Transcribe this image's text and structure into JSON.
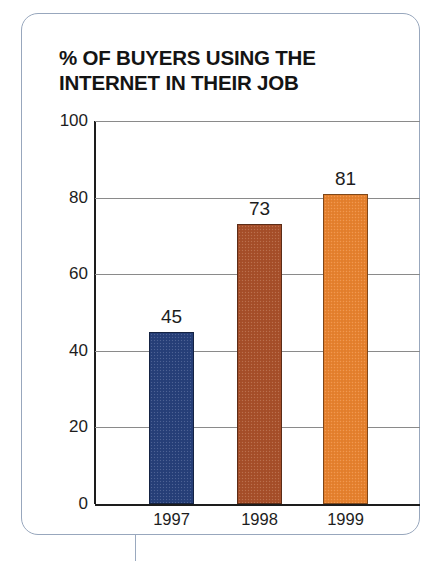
{
  "card": {
    "title": "% OF BUYERS USING THE\nINTERNET IN THEIR JOB",
    "border_color": "#98a7bd"
  },
  "chart_data": {
    "type": "bar",
    "title": "% OF BUYERS USING THE INTERNET IN THEIR JOB",
    "xlabel": "",
    "ylabel": "",
    "ylim": [
      0,
      100
    ],
    "yticks": [
      0,
      20,
      40,
      60,
      80,
      100
    ],
    "grid": true,
    "legend": "none",
    "categories": [
      "1997",
      "1998",
      "1999"
    ],
    "values": [
      45,
      73,
      81
    ],
    "value_labels": [
      "45",
      "73",
      "81"
    ],
    "bar_colors": [
      "#27407a",
      "#a8502a",
      "#e8822e"
    ],
    "series": [
      {
        "name": "% of buyers using the internet in their job",
        "values": [
          45,
          73,
          81
        ]
      }
    ]
  }
}
